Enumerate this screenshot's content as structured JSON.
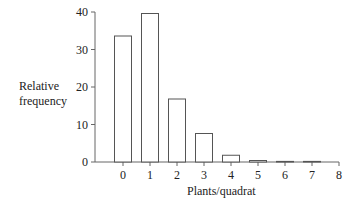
{
  "chart_data": {
    "type": "bar",
    "title": "",
    "xlabel": "Plants/quadrat",
    "ylabel": "Relative frequency",
    "ylabel_lines": [
      "Relative",
      "frequency"
    ],
    "categories": [
      "0",
      "1",
      "2",
      "3",
      "4",
      "5",
      "6",
      "7"
    ],
    "values": [
      33.6,
      39.6,
      16.8,
      7.6,
      1.8,
      0.4,
      0.1,
      0.1
    ],
    "x_ticks": [
      "0",
      "1",
      "2",
      "3",
      "4",
      "5",
      "6",
      "7",
      "8"
    ],
    "y_ticks": [
      0,
      10,
      20,
      30,
      40
    ],
    "ylim": [
      0,
      40
    ],
    "grid": false,
    "legend": null,
    "bar_fill": "#ffffff",
    "bar_stroke": "#555555",
    "axis_color": "#666666"
  }
}
